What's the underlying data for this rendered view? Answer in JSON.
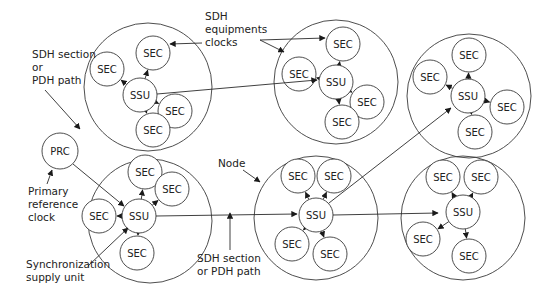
{
  "diagram": {
    "type": "synchronization-network",
    "node_labels": {
      "ssu": "SSU",
      "sec": "SEC",
      "prc": "PRC"
    },
    "nodes": [
      {
        "id": "node-top-left",
        "ssu": "SSU",
        "secs": [
          "SEC",
          "SEC",
          "SEC",
          "SEC"
        ]
      },
      {
        "id": "node-top-middle",
        "ssu": "SSU",
        "secs": [
          "SEC",
          "SEC",
          "SEC",
          "SEC"
        ]
      },
      {
        "id": "node-top-right",
        "ssu": "SSU",
        "secs": [
          "SEC",
          "SEC",
          "SEC",
          "SEC"
        ]
      },
      {
        "id": "node-bottom-left",
        "ssu": "SSU",
        "secs": [
          "SEC",
          "SEC",
          "SEC",
          "SEC"
        ]
      },
      {
        "id": "node-bottom-middle",
        "ssu": "SSU",
        "secs": [
          "SEC",
          "SEC",
          "SEC",
          "SEC"
        ]
      },
      {
        "id": "node-bottom-right",
        "ssu": "SSU",
        "secs": [
          "SEC",
          "SEC",
          "SEC",
          "SEC"
        ]
      }
    ],
    "prc": "PRC",
    "connections": [
      {
        "from": "PRC",
        "to": "node-bottom-left"
      },
      {
        "from": "node-top-left",
        "to": "node-top-middle"
      },
      {
        "from": "node-bottom-left",
        "to": "node-bottom-middle"
      },
      {
        "from": "node-bottom-middle",
        "to": "node-top-right"
      },
      {
        "from": "node-bottom-middle",
        "to": "node-bottom-right"
      }
    ],
    "annotations": {
      "sdh_section_top": [
        "SDH section",
        "or",
        "PDH path"
      ],
      "sdh_equipment_clocks": [
        "SDH",
        "equipments",
        "clocks"
      ],
      "primary_reference_clock": [
        "Primary",
        "reference",
        "clock"
      ],
      "synchronization_supply_unit": [
        "Synchronization",
        "supply unit"
      ],
      "node": [
        "Node"
      ],
      "sdh_section_bottom": [
        "SDH section",
        "or PDH path"
      ]
    }
  }
}
